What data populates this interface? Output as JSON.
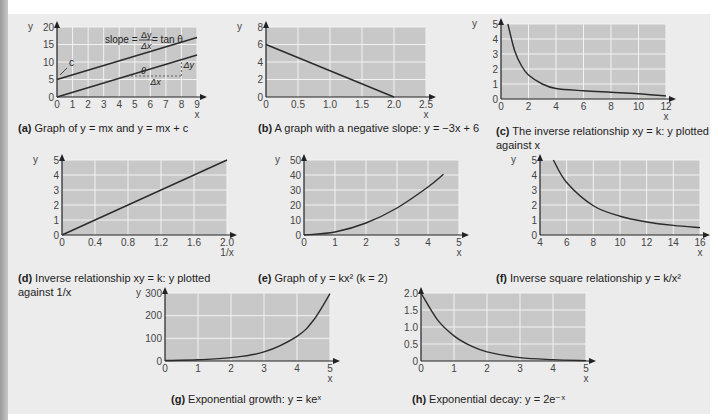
{
  "chart_data": [
    {
      "id": "a",
      "type": "line",
      "caption_label": "(a)",
      "caption": "Graph of y = mx and y = mx + c",
      "xlabel": "x",
      "ylabel": "y",
      "xticks": [
        0,
        1,
        2,
        3,
        4,
        5,
        6,
        7,
        8,
        9
      ],
      "yticks": [
        0,
        5,
        10,
        15,
        20
      ],
      "xlim": [
        0,
        9
      ],
      "ylim": [
        0,
        20
      ],
      "grid": true,
      "series": [
        {
          "name": "y = mx",
          "x": [
            0,
            9
          ],
          "y": [
            0,
            12
          ]
        },
        {
          "name": "y = mx + c",
          "x": [
            0,
            9
          ],
          "y": [
            5,
            17
          ]
        }
      ],
      "annotations": [
        "slope = Δy/Δx = tan θ",
        "c",
        "θ",
        "Δx",
        "Δy"
      ]
    },
    {
      "id": "b",
      "type": "line",
      "caption_label": "(b)",
      "caption": "A graph with a negative slope: y = −3x + 6",
      "xlabel": "x",
      "ylabel": "y",
      "xticks": [
        "0",
        "0.5",
        "1.0",
        "1.5",
        "2.0",
        "2.5"
      ],
      "yticks": [
        0,
        2,
        4,
        6,
        8
      ],
      "xlim": [
        0,
        2.5
      ],
      "ylim": [
        0,
        8
      ],
      "grid": true,
      "series": [
        {
          "name": "y = -3x + 6",
          "x": [
            0,
            2
          ],
          "y": [
            6,
            0
          ]
        }
      ]
    },
    {
      "id": "c",
      "type": "line",
      "caption_label": "(c)",
      "caption": "The inverse relationship xy = k: y plotted against x",
      "xlabel": "x",
      "ylabel": "y",
      "xticks": [
        0,
        2,
        4,
        6,
        8,
        10,
        12
      ],
      "yticks": [
        0,
        1,
        2,
        3,
        4,
        5
      ],
      "xlim": [
        0,
        12
      ],
      "ylim": [
        0,
        5
      ],
      "grid": true,
      "series": [
        {
          "name": "y = k/x",
          "x": [
            0.5,
            1,
            1.5,
            2,
            3,
            4,
            6,
            8,
            10,
            12
          ],
          "y": [
            5,
            3.2,
            2.2,
            1.6,
            1.0,
            0.7,
            0.55,
            0.45,
            0.35,
            0.2
          ]
        }
      ]
    },
    {
      "id": "d",
      "type": "line",
      "caption_label": "(d)",
      "caption": "Inverse relationship xy = k: y plotted against 1/x",
      "xlabel": "1/x",
      "ylabel": "y",
      "xticks": [
        "0",
        "0.4",
        "0.8",
        "1.2",
        "1.6",
        "2.0"
      ],
      "yticks": [
        0,
        1,
        2,
        3,
        4,
        5
      ],
      "xlim": [
        0,
        2
      ],
      "ylim": [
        0,
        5
      ],
      "grid": true,
      "series": [
        {
          "name": "y vs 1/x",
          "x": [
            0,
            2
          ],
          "y": [
            0,
            5
          ]
        }
      ]
    },
    {
      "id": "e",
      "type": "line",
      "caption_label": "(e)",
      "caption": "Graph of y = kx² (k = 2)",
      "xlabel": "x",
      "ylabel": "y",
      "xticks": [
        0,
        1,
        2,
        3,
        4,
        5
      ],
      "yticks": [
        0,
        10,
        20,
        30,
        40,
        50
      ],
      "xlim": [
        0,
        5
      ],
      "ylim": [
        0,
        50
      ],
      "grid": true,
      "series": [
        {
          "name": "y = 2x^2",
          "x": [
            0,
            1,
            2,
            3,
            4,
            4.5
          ],
          "y": [
            0,
            2,
            8,
            18,
            32,
            40.5
          ]
        }
      ]
    },
    {
      "id": "f",
      "type": "line",
      "caption_label": "(f)",
      "caption": "Inverse square relationship y = k/x²",
      "xlabel": "x",
      "ylabel": "y",
      "xticks": [
        4,
        6,
        8,
        10,
        12,
        14,
        16
      ],
      "yticks": [
        0,
        1,
        2,
        3,
        4,
        5
      ],
      "xlim": [
        4,
        16
      ],
      "ylim": [
        0,
        5
      ],
      "grid": true,
      "series": [
        {
          "name": "y = k/x^2",
          "x": [
            5,
            6,
            8,
            10,
            12,
            14,
            16
          ],
          "y": [
            5,
            3.5,
            1.95,
            1.25,
            0.87,
            0.64,
            0.49
          ]
        }
      ]
    },
    {
      "id": "g",
      "type": "line",
      "caption_label": "(g)",
      "caption": "Exponential growth: y = keˣ",
      "xlabel": "x",
      "ylabel": "y",
      "xticks": [
        0,
        1,
        2,
        3,
        4,
        5
      ],
      "yticks": [
        0,
        100,
        200,
        300
      ],
      "xlim": [
        0,
        5
      ],
      "ylim": [
        0,
        300
      ],
      "grid": true,
      "series": [
        {
          "name": "y = 2e^x",
          "x": [
            0,
            1,
            2,
            3,
            4,
            4.5,
            5
          ],
          "y": [
            2,
            5.4,
            14.8,
            40,
            109,
            180,
            297
          ]
        }
      ]
    },
    {
      "id": "h",
      "type": "line",
      "caption_label": "(h)",
      "caption": "Exponential decay: y = 2e⁻ˣ",
      "xlabel": "x",
      "ylabel": "",
      "xticks": [
        0,
        1,
        2,
        3,
        4,
        5
      ],
      "yticks": [
        "0",
        "0.5",
        "1.0",
        "1.5",
        "2.0"
      ],
      "xlim": [
        0,
        5
      ],
      "ylim": [
        0,
        2
      ],
      "grid": true,
      "series": [
        {
          "name": "y = 2e^-x",
          "x": [
            0,
            0.5,
            1,
            1.5,
            2,
            3,
            4,
            5
          ],
          "y": [
            2,
            1.21,
            0.74,
            0.45,
            0.27,
            0.1,
            0.04,
            0.01
          ]
        }
      ]
    }
  ],
  "captions": {
    "a": {
      "label": "(a)",
      "text": "Graph of y = mx and y = mx + c"
    },
    "b": {
      "label": "(b)",
      "text": "A graph with a negative slope: y = −3x + 6"
    },
    "c": {
      "label": "(c)",
      "line1": "The inverse relationship xy = k: y plotted",
      "line2": "against x"
    },
    "d": {
      "label": "(d)",
      "line1": "Inverse relationship xy = k: y plotted",
      "line2": "against 1/x"
    },
    "e": {
      "label": "(e)",
      "text": "Graph of y = kx² (k = 2)"
    },
    "f": {
      "label": "(f)",
      "text": "Inverse square relationship y = k/x²"
    },
    "g": {
      "label": "(g)",
      "text": "Exponential growth: y = keˣ"
    },
    "h": {
      "label": "(h)",
      "text": "Exponential decay: y = 2e⁻ˣ"
    }
  },
  "colors": {
    "plot_bg": "#c8c8c8",
    "grid": "#f2f2f2",
    "line": "#2b2b2b",
    "panel_bg": "#ececec"
  }
}
